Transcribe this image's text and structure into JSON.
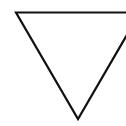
{
  "figure": {
    "shape": "inverted-triangle-outline",
    "stroke_color": "#111111",
    "background_color": "#ffffff",
    "stroke_width": 2.2,
    "vertices": [
      [
        16,
        12
      ],
      [
        140,
        12
      ],
      [
        78,
        120
      ]
    ]
  }
}
